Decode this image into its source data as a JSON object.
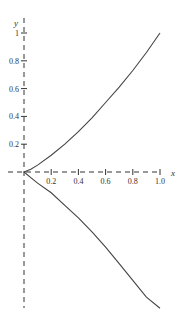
{
  "chart_data": {
    "type": "line",
    "title": "",
    "xlabel": "x",
    "ylabel": "y",
    "xlim": [
      0,
      1.0
    ],
    "ylim": [
      -1.0,
      1.05
    ],
    "grid": false,
    "legend": null,
    "x_ticks": [
      "0.2",
      "0.4",
      "0.6",
      "0.8",
      "1.0"
    ],
    "y_ticks": [
      "0.2",
      "0.4",
      "0.6",
      "0.8",
      "1"
    ],
    "series": [
      {
        "name": "upper branch",
        "x": [
          0,
          0.05,
          0.1,
          0.2,
          0.3,
          0.4,
          0.5,
          0.6,
          0.7,
          0.8,
          0.9,
          1.0
        ],
        "y": [
          0,
          0.02,
          0.05,
          0.12,
          0.2,
          0.29,
          0.39,
          0.5,
          0.61,
          0.73,
          0.86,
          1.0
        ]
      },
      {
        "name": "lower branch",
        "x": [
          0,
          0.05,
          0.1,
          0.2,
          0.3,
          0.4,
          0.5,
          0.6,
          0.7,
          0.8,
          0.9,
          1.0
        ],
        "y": [
          0,
          -0.04,
          -0.08,
          -0.15,
          -0.24,
          -0.33,
          -0.43,
          -0.54,
          -0.66,
          -0.78,
          -0.9,
          -0.98
        ]
      }
    ],
    "axes_style": "dashed"
  }
}
